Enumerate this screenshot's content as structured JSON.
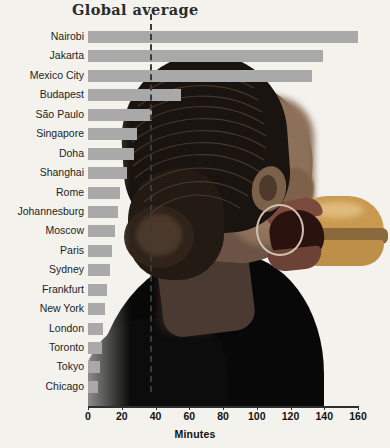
{
  "chart_data": {
    "type": "bar",
    "orientation": "horizontal",
    "title": "Global average",
    "xlabel": "Minutes",
    "ylabel": "",
    "xlim": [
      0,
      160
    ],
    "xticks": [
      0,
      20,
      40,
      60,
      80,
      100,
      120,
      140,
      160
    ],
    "grid": false,
    "legend": null,
    "annotations": [
      {
        "label": "Global average",
        "type": "vertical-dashed-line",
        "value": 37
      }
    ],
    "categories": [
      "Nairobi",
      "Jakarta",
      "Mexico City",
      "Budapest",
      "São Paulo",
      "Singapore",
      "Doha",
      "Shanghai",
      "Rome",
      "Johannesburg",
      "Moscow",
      "Paris",
      "Sydney",
      "Frankfurt",
      "New York",
      "London",
      "Toronto",
      "Tokyo",
      "Chicago"
    ],
    "values": [
      160,
      139,
      133,
      55,
      38,
      29,
      27,
      23,
      19,
      18,
      16,
      14,
      13,
      11,
      10,
      9,
      8,
      7,
      6
    ],
    "bar_color": "#a9a9a9",
    "background_color": "#f3f2ed",
    "average_line_color": "#3a3a3a"
  },
  "axis": {
    "tick_labels": [
      "0",
      "20",
      "40",
      "60",
      "80",
      "100",
      "120",
      "140",
      "160"
    ],
    "title": "Minutes"
  },
  "photo": {
    "description": "woman-eating-burger"
  }
}
